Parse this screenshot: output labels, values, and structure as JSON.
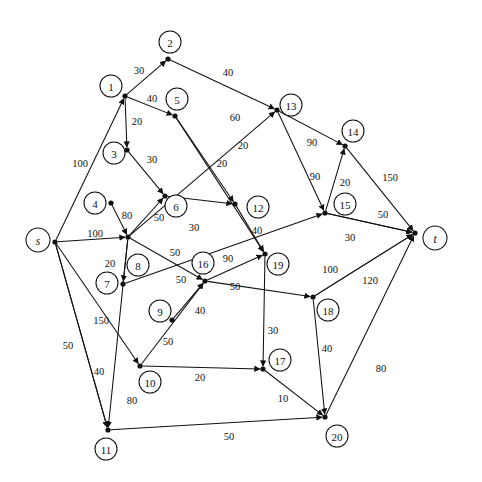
{
  "diagram": {
    "type": "directed-network",
    "colors": {
      "stroke": "#111111",
      "background": "#ffffff",
      "node_fill": "#ffffff"
    },
    "nodes": [
      {
        "id": "s",
        "label": "s",
        "dot": [
          55,
          242
        ],
        "circle": [
          38,
          240
        ],
        "r": 12,
        "terminal": true
      },
      {
        "id": "t",
        "label": "t",
        "dot": [
          415,
          233
        ],
        "circle": [
          435,
          238
        ],
        "r": 12,
        "terminal": true
      },
      {
        "id": "1",
        "label": "1",
        "dot": [
          125,
          96
        ],
        "circle": [
          111,
          86
        ],
        "r": 11,
        "terminal": false
      },
      {
        "id": "2",
        "label": "2",
        "dot": [
          168,
          59
        ],
        "circle": [
          170,
          42
        ],
        "r": 11,
        "terminal": false
      },
      {
        "id": "3",
        "label": "3",
        "dot": [
          127,
          150
        ],
        "circle": [
          114,
          153
        ],
        "r": 11,
        "terminal": false
      },
      {
        "id": "4",
        "label": "4",
        "dot": [
          111,
          203
        ],
        "circle": [
          95,
          203
        ],
        "r": 11,
        "terminal": false
      },
      {
        "id": "5",
        "label": "5",
        "dot": [
          175,
          116
        ],
        "circle": [
          177,
          99
        ],
        "r": 11,
        "terminal": false
      },
      {
        "id": "6",
        "label": "6",
        "dot": [
          165,
          196
        ],
        "circle": [
          176,
          206
        ],
        "r": 11,
        "terminal": false
      },
      {
        "id": "7",
        "label": "7",
        "dot": [
          123,
          284
        ],
        "circle": [
          107,
          283
        ],
        "r": 11,
        "terminal": false
      },
      {
        "id": "8",
        "label": "8",
        "dot": [
          128,
          237
        ],
        "circle": [
          138,
          265
        ],
        "r": 11,
        "terminal": false
      },
      {
        "id": "9",
        "label": "9",
        "dot": [
          172,
          320
        ],
        "circle": [
          160,
          311
        ],
        "r": 11,
        "terminal": false
      },
      {
        "id": "10",
        "label": "10",
        "dot": [
          140,
          366
        ],
        "circle": [
          150,
          382
        ],
        "r": 11,
        "terminal": false
      },
      {
        "id": "11",
        "label": "11",
        "dot": [
          108,
          430
        ],
        "circle": [
          106,
          449
        ],
        "r": 11,
        "terminal": false
      },
      {
        "id": "12",
        "label": "12",
        "dot": [
          235,
          204
        ],
        "circle": [
          258,
          207
        ],
        "r": 11,
        "terminal": false
      },
      {
        "id": "13",
        "label": "13",
        "dot": [
          277,
          110
        ],
        "circle": [
          291,
          105
        ],
        "r": 11,
        "terminal": false
      },
      {
        "id": "14",
        "label": "14",
        "dot": [
          345,
          146
        ],
        "circle": [
          353,
          131
        ],
        "r": 11,
        "terminal": false
      },
      {
        "id": "15",
        "label": "15",
        "dot": [
          325,
          213
        ],
        "circle": [
          345,
          204
        ],
        "r": 11,
        "terminal": false
      },
      {
        "id": "16",
        "label": "16",
        "dot": [
          205,
          281
        ],
        "circle": [
          203,
          263
        ],
        "r": 11,
        "terminal": false
      },
      {
        "id": "17",
        "label": "17",
        "dot": [
          263,
          369
        ],
        "circle": [
          280,
          360
        ],
        "r": 11,
        "terminal": false
      },
      {
        "id": "18",
        "label": "18",
        "dot": [
          313,
          297
        ],
        "circle": [
          328,
          310
        ],
        "r": 11,
        "terminal": false
      },
      {
        "id": "19",
        "label": "19",
        "dot": [
          265,
          254
        ],
        "circle": [
          278,
          264
        ],
        "r": 11,
        "terminal": false
      },
      {
        "id": "20",
        "label": "20",
        "dot": [
          325,
          417
        ],
        "circle": [
          337,
          436
        ],
        "r": 11,
        "terminal": false
      }
    ],
    "edges": [
      {
        "from": "s",
        "to": "1",
        "capacity": "100",
        "label_pos": [
          80,
          163
        ]
      },
      {
        "from": "s",
        "to": "8",
        "capacity": "100",
        "label_pos": [
          95,
          233
        ]
      },
      {
        "from": "s",
        "to": "10",
        "capacity": "150",
        "label_pos": [
          101,
          320
        ]
      },
      {
        "from": "s",
        "to": "11",
        "capacity": "50",
        "label_pos": [
          68,
          345
        ]
      },
      {
        "from": "s",
        "to": "11",
        "capacity": "40",
        "label_pos": [
          99,
          371
        ]
      },
      {
        "from": "1",
        "to": "2",
        "capacity": "30",
        "label_pos": [
          139,
          70
        ]
      },
      {
        "from": "1",
        "to": "5",
        "capacity": "40",
        "label_pos": [
          152,
          98
        ]
      },
      {
        "from": "1",
        "to": "3",
        "capacity": "20",
        "label_pos": [
          137,
          121
        ]
      },
      {
        "from": "2",
        "to": "13",
        "capacity": "40",
        "label_pos": [
          228,
          72
        ]
      },
      {
        "from": "3",
        "to": "6",
        "capacity": "30",
        "label_pos": [
          152,
          159
        ]
      },
      {
        "from": "5",
        "to": "12",
        "capacity": "20",
        "label_pos": [
          222,
          163
        ]
      },
      {
        "from": "5",
        "to": "19",
        "capacity": "20",
        "label_pos": [
          243,
          145
        ]
      },
      {
        "from": "4",
        "to": "8",
        "capacity": "80",
        "label_pos": [
          127,
          215
        ]
      },
      {
        "from": "8",
        "to": "6",
        "capacity": "50",
        "label_pos": [
          159,
          217
        ]
      },
      {
        "from": "6",
        "to": "12",
        "capacity": "30",
        "label_pos": [
          194,
          227
        ]
      },
      {
        "from": "8",
        "to": "13",
        "capacity": "60",
        "label_pos": [
          235,
          117
        ]
      },
      {
        "from": "8",
        "to": "7",
        "capacity": "20",
        "label_pos": [
          110,
          263
        ]
      },
      {
        "from": "8",
        "to": "16",
        "capacity": "50",
        "label_pos": [
          175,
          252
        ]
      },
      {
        "from": "8",
        "to": "11",
        "capacity": "80",
        "label_pos": [
          132,
          400
        ]
      },
      {
        "from": "12",
        "to": "19",
        "capacity": "40",
        "label_pos": [
          257,
          230
        ]
      },
      {
        "from": "16",
        "to": "19",
        "capacity": "90",
        "label_pos": [
          228,
          258
        ]
      },
      {
        "from": "16",
        "to": "18",
        "capacity": "50",
        "label_pos": [
          235,
          286
        ]
      },
      {
        "from": "7",
        "to": "15",
        "capacity": "50",
        "label_pos": [
          181,
          279
        ]
      },
      {
        "from": "10",
        "to": "16",
        "capacity": "50",
        "label_pos": [
          168,
          341
        ]
      },
      {
        "from": "9",
        "to": "16",
        "capacity": "40",
        "label_pos": [
          200,
          310
        ]
      },
      {
        "from": "10",
        "to": "17",
        "capacity": "20",
        "label_pos": [
          200,
          377
        ]
      },
      {
        "from": "11",
        "to": "20",
        "capacity": "50",
        "label_pos": [
          229,
          436
        ]
      },
      {
        "from": "13",
        "to": "14",
        "capacity": "90",
        "label_pos": [
          312,
          142
        ]
      },
      {
        "from": "13",
        "to": "15",
        "capacity": "90",
        "label_pos": [
          315,
          176
        ]
      },
      {
        "from": "15",
        "to": "14",
        "capacity": "20",
        "label_pos": [
          345,
          182
        ]
      },
      {
        "from": "14",
        "to": "t",
        "capacity": "150",
        "label_pos": [
          390,
          177
        ]
      },
      {
        "from": "15",
        "to": "t",
        "capacity": "50",
        "label_pos": [
          383,
          214
        ]
      },
      {
        "from": "15",
        "to": "t",
        "capacity": "30",
        "label_pos": [
          350,
          237
        ]
      },
      {
        "from": "18",
        "to": "t",
        "capacity": "100",
        "label_pos": [
          330,
          269
        ]
      },
      {
        "from": "18",
        "to": "t",
        "capacity": "120",
        "label_pos": [
          370,
          280
        ]
      },
      {
        "from": "19",
        "to": "17",
        "capacity": "30",
        "label_pos": [
          273,
          330
        ]
      },
      {
        "from": "18",
        "to": "20",
        "capacity": "40",
        "label_pos": [
          327,
          348
        ]
      },
      {
        "from": "17",
        "to": "20",
        "capacity": "10",
        "label_pos": [
          283,
          398
        ]
      },
      {
        "from": "20",
        "to": "t",
        "capacity": "80",
        "label_pos": [
          381,
          368
        ]
      }
    ]
  }
}
